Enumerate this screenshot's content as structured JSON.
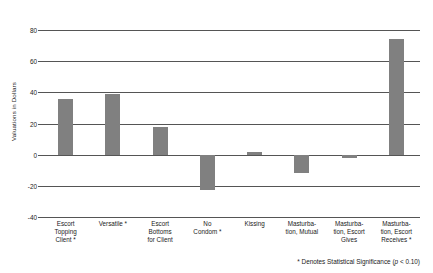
{
  "chart_data": {
    "type": "bar",
    "title": "",
    "xlabel": "",
    "ylabel": "Valuations in Dollars",
    "ylim": [
      -40,
      80
    ],
    "yticks": [
      -40,
      -20,
      0,
      20,
      40,
      60,
      80
    ],
    "ytick_labels": [
      "-40",
      "-20",
      "0",
      "20",
      "40",
      "60",
      "80"
    ],
    "grid": true,
    "legend": "none",
    "bar_color": "#808080",
    "categories": [
      "Escort Topping Client *",
      "Versatile *",
      "Escort Bottoms for Client",
      "No Condom *",
      "Kissing",
      "Masturbation, Mutual",
      "Masturbation, Escort Gives",
      "Masturbation, Escort Receives *"
    ],
    "category_lines": [
      [
        "Escort",
        "Topping",
        "Client *"
      ],
      [
        "Versatile *"
      ],
      [
        "Escort",
        "Bottoms",
        "for Client"
      ],
      [
        "No",
        "Condom *"
      ],
      [
        "Kissing"
      ],
      [
        "Masturba-",
        "tion, Mutual"
      ],
      [
        "Masturba-",
        "tion, Escort",
        "Gives"
      ],
      [
        "Masturba-",
        "tion, Escort",
        "Receives *"
      ]
    ],
    "values": [
      36,
      39,
      18,
      -23,
      1.5,
      -12,
      -2,
      74
    ],
    "significant": [
      true,
      true,
      false,
      true,
      false,
      false,
      false,
      true
    ],
    "annotations": [
      "* Denotes Statistical Significance (p < 0.10)"
    ]
  },
  "footnote": {
    "prefix": "* Denotes Statistical Significance (",
    "italic": "p",
    "suffix": " < 0.10)"
  }
}
